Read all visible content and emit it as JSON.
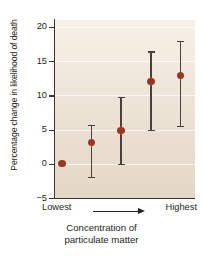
{
  "chart_data": {
    "type": "scatter",
    "title": "",
    "xlabel": "Concentration of particulate matter",
    "ylabel": "Percentage change in likelihood of death",
    "ylim": [
      -5,
      21
    ],
    "yticks": [
      -5,
      0,
      5,
      10,
      15,
      20
    ],
    "ytick_labels": [
      "−5",
      "0",
      "5",
      "10",
      "15",
      "20"
    ],
    "grid": true,
    "legend": false,
    "x_axis_low_label": "Lowest",
    "x_axis_high_label": "Highest",
    "x_axis_arrow": "arrow-right",
    "categories": [
      "Lowest",
      "2",
      "3",
      "4",
      "Highest"
    ],
    "series": [
      {
        "name": "Percentage change in likelihood of death",
        "marker_color": "#a13322",
        "errorbar_color": "#4a423a",
        "values": [
          0.0,
          3.1,
          4.8,
          12.0,
          12.9
        ],
        "error_low": [
          0.0,
          -1.9,
          0.0,
          5.0,
          5.5
        ],
        "error_high": [
          0.0,
          5.7,
          9.8,
          16.4,
          18.0
        ],
        "has_error_bars": [
          false,
          true,
          true,
          true,
          true
        ]
      }
    ],
    "plot_background": "#ece2d4",
    "axis_color": "#3a3531"
  },
  "axis": {
    "ytick_labels": [
      "20",
      "15",
      "10",
      "5",
      "0",
      "−5"
    ],
    "xlabel_line1": "Concentration of",
    "xlabel_line2": "particulate matter",
    "lowest": "Lowest",
    "highest": "Highest",
    "ylabel": "Percentage change in likelihood of death"
  }
}
